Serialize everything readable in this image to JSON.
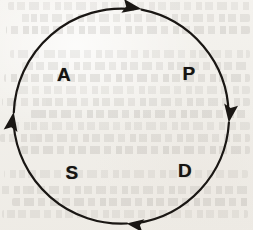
{
  "diagram": {
    "name": "pdsa-cycle",
    "shape": "circle",
    "direction": "clockwise",
    "stroke_color": "#1a1714",
    "background_color": "#f2f0ec",
    "circle": {
      "cx": 121,
      "cy": 116,
      "r": 108,
      "stroke_width": 2.2
    },
    "labels": [
      {
        "id": "plan",
        "text": "P",
        "x": 189,
        "y": 73,
        "quadrant": "top-right"
      },
      {
        "id": "do",
        "text": "D",
        "x": 185,
        "y": 170,
        "quadrant": "bottom-right"
      },
      {
        "id": "study",
        "text": "S",
        "x": 72,
        "y": 172,
        "quadrant": "bottom-left"
      },
      {
        "id": "act",
        "text": "A",
        "x": 64,
        "y": 74,
        "quadrant": "top-left"
      }
    ],
    "arrowheads": [
      {
        "id": "top",
        "position": "top",
        "points": "right",
        "x": 137,
        "y": 9,
        "angle": 12
      },
      {
        "id": "right",
        "position": "right",
        "points": "down",
        "x": 228,
        "y": 118,
        "angle": 100
      },
      {
        "id": "bottom",
        "position": "bottom",
        "points": "left",
        "x": 131,
        "y": 223,
        "angle": 188
      },
      {
        "id": "left",
        "position": "left",
        "points": "up",
        "x": 14,
        "y": 119,
        "angle": 281
      }
    ]
  },
  "background": {
    "type": "scanned-paper-bleed-through",
    "ghost_lines": [
      {
        "y": 2,
        "x": 8,
        "w": 243
      },
      {
        "y": 14,
        "x": 18,
        "w": 232
      },
      {
        "y": 26,
        "x": 6,
        "w": 244
      },
      {
        "y": 50,
        "x": 10,
        "w": 240
      },
      {
        "y": 62,
        "x": 22,
        "w": 228
      },
      {
        "y": 74,
        "x": 4,
        "w": 246
      },
      {
        "y": 86,
        "x": 14,
        "w": 236
      },
      {
        "y": 98,
        "x": 2,
        "w": 248
      },
      {
        "y": 110,
        "x": 30,
        "w": 218
      },
      {
        "y": 122,
        "x": 8,
        "w": 242
      },
      {
        "y": 134,
        "x": 0,
        "w": 250
      },
      {
        "y": 146,
        "x": 20,
        "w": 230
      },
      {
        "y": 170,
        "x": 4,
        "w": 244
      },
      {
        "y": 186,
        "x": 0,
        "w": 249
      },
      {
        "y": 198,
        "x": 12,
        "w": 238
      },
      {
        "y": 210,
        "x": 2,
        "w": 246
      }
    ]
  }
}
